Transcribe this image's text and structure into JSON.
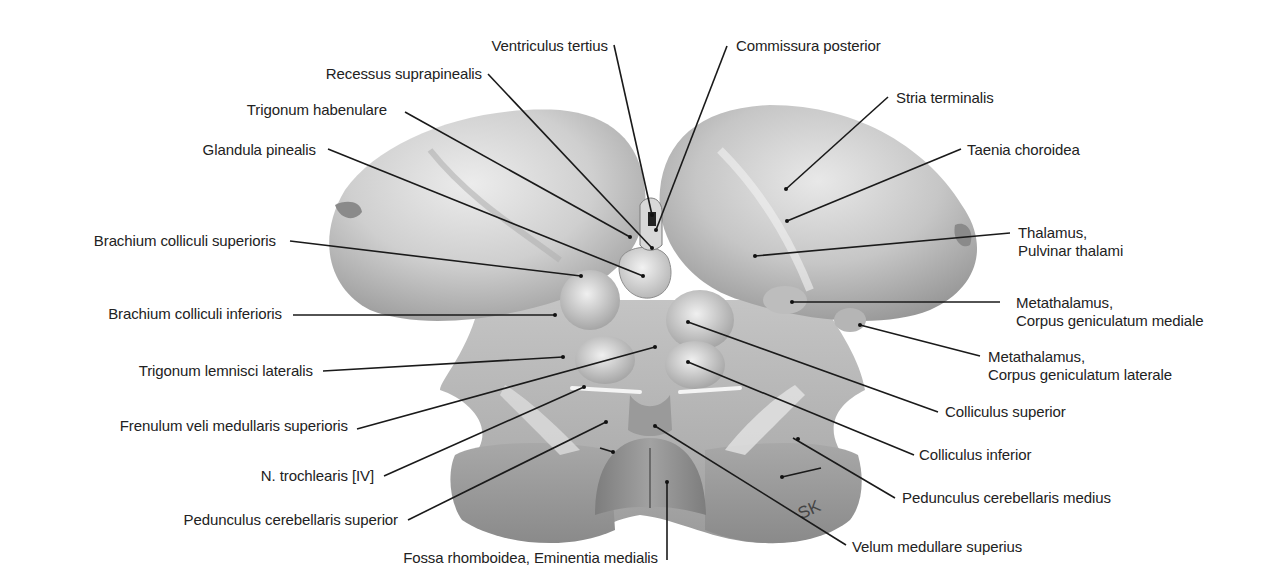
{
  "figure": {
    "signature": "SK",
    "colors": {
      "background": "#ffffff",
      "tissue_light": "#e2e2e2",
      "tissue_mid": "#b8b8b8",
      "tissue_dark": "#8e8e8e",
      "leader": "#1a1a1a",
      "text": "#222222"
    }
  },
  "labels": {
    "ventriculus_tertius": "Ventriculus tertius",
    "commissura_posterior": "Commissura posterior",
    "recessus_suprapinealis": "Recessus suprapinealis",
    "trigonum_habenulare": "Trigonum habenulare",
    "glandula_pinealis": "Glandula pinealis",
    "stria_terminalis": "Stria terminalis",
    "taenia_choroidea": "Taenia choroidea",
    "brachium_colliculi_superioris": "Brachium colliculi superioris",
    "thalamus_line1": "Thalamus,",
    "thalamus_line2": "Pulvinar thalami",
    "brachium_colliculi_inferioris": "Brachium colliculi inferioris",
    "cgm_line1": "Metathalamus,",
    "cgm_line2": "Corpus geniculatum mediale",
    "trigonum_lemnisci_lateralis": "Trigonum lemnisci lateralis",
    "cgl_line1": "Metathalamus,",
    "cgl_line2": "Corpus geniculatum laterale",
    "colliculus_superior": "Colliculus superior",
    "frenulum": "Frenulum veli medullaris superioris",
    "colliculus_inferior": "Colliculus inferior",
    "n_trochlearis": "N. trochlearis [IV]",
    "pedunculus_medius": "Pedunculus cerebellaris medius",
    "pedunculus_superior": "Pedunculus cerebellaris superior",
    "velum": "Velum medullare superius",
    "fossa": "Fossa rhomboidea, Eminentia medialis"
  }
}
